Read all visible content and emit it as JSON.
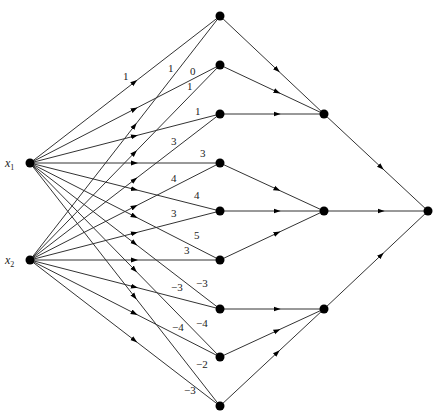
{
  "diagram": {
    "type": "network",
    "inputs": [
      {
        "id": "x1",
        "label": "x",
        "sub": "1",
        "x": 30,
        "y": 163
      },
      {
        "id": "x2",
        "label": "x",
        "sub": "2",
        "x": 30,
        "y": 260
      }
    ],
    "layer1": [
      {
        "id": "h1",
        "x": 220,
        "y": 16
      },
      {
        "id": "h2",
        "x": 220,
        "y": 65
      },
      {
        "id": "h3",
        "x": 220,
        "y": 114
      },
      {
        "id": "h4",
        "x": 220,
        "y": 163
      },
      {
        "id": "h5",
        "x": 220,
        "y": 211
      },
      {
        "id": "h6",
        "x": 220,
        "y": 260
      },
      {
        "id": "h7",
        "x": 220,
        "y": 309
      },
      {
        "id": "h8",
        "x": 220,
        "y": 357
      },
      {
        "id": "h9",
        "x": 220,
        "y": 406
      }
    ],
    "layer2": [
      {
        "id": "g1",
        "x": 324,
        "y": 114
      },
      {
        "id": "g2",
        "x": 324,
        "y": 211
      },
      {
        "id": "g3",
        "x": 324,
        "y": 309
      }
    ],
    "output": {
      "id": "out",
      "x": 428,
      "y": 211
    },
    "weighted_edges": [
      {
        "from": "x1",
        "to": "h1",
        "weight": "1",
        "lx": 123,
        "ly": 80
      },
      {
        "from": "x2",
        "to": "h1",
        "weight": "1",
        "lx": 168,
        "ly": 72
      },
      {
        "from": "x1",
        "to": "h2",
        "weight": "0",
        "lx": 190,
        "ly": 75
      },
      {
        "from": "x2",
        "to": "h2",
        "weight": "1",
        "lx": 187,
        "ly": 90
      },
      {
        "from": "x1",
        "to": "h3",
        "weight": "1",
        "lx": 195,
        "ly": 115
      },
      {
        "from": "x2",
        "to": "h3",
        "weight": "3",
        "lx": 171,
        "ly": 145
      },
      {
        "from": "x1",
        "to": "h4",
        "weight": "3",
        "lx": 200,
        "ly": 157
      },
      {
        "from": "x2",
        "to": "h4",
        "weight": "4",
        "lx": 171,
        "ly": 182
      },
      {
        "from": "x1",
        "to": "h5",
        "weight": "4",
        "lx": 194,
        "ly": 199
      },
      {
        "from": "x2",
        "to": "h5",
        "weight": "3",
        "lx": 171,
        "ly": 217
      },
      {
        "from": "x1",
        "to": "h6",
        "weight": "5",
        "lx": 194,
        "ly": 239
      },
      {
        "from": "x2",
        "to": "h6",
        "weight": "3",
        "lx": 184,
        "ly": 254
      },
      {
        "from": "x1",
        "to": "h7",
        "weight": "−3",
        "lx": 196,
        "ly": 287
      },
      {
        "from": "x2",
        "to": "h7",
        "weight": "−3",
        "lx": 171,
        "ly": 291
      },
      {
        "from": "x1",
        "to": "h8",
        "weight": "−4",
        "lx": 196,
        "ly": 327
      },
      {
        "from": "x2",
        "to": "h8",
        "weight": "−4",
        "lx": 172,
        "ly": 331
      },
      {
        "from": "x1",
        "to": "h9",
        "weight": "−2",
        "lx": 196,
        "ly": 368
      },
      {
        "from": "x2",
        "to": "h9",
        "weight": "−3",
        "lx": 184,
        "ly": 394
      }
    ],
    "unweighted_edges": [
      {
        "from": "h1",
        "to": "g1"
      },
      {
        "from": "h2",
        "to": "g1"
      },
      {
        "from": "h3",
        "to": "g1"
      },
      {
        "from": "h4",
        "to": "g2"
      },
      {
        "from": "h5",
        "to": "g2"
      },
      {
        "from": "h6",
        "to": "g2"
      },
      {
        "from": "h7",
        "to": "g3"
      },
      {
        "from": "h8",
        "to": "g3"
      },
      {
        "from": "h9",
        "to": "g3"
      },
      {
        "from": "g1",
        "to": "out"
      },
      {
        "from": "g2",
        "to": "out"
      },
      {
        "from": "g3",
        "to": "out"
      }
    ]
  }
}
